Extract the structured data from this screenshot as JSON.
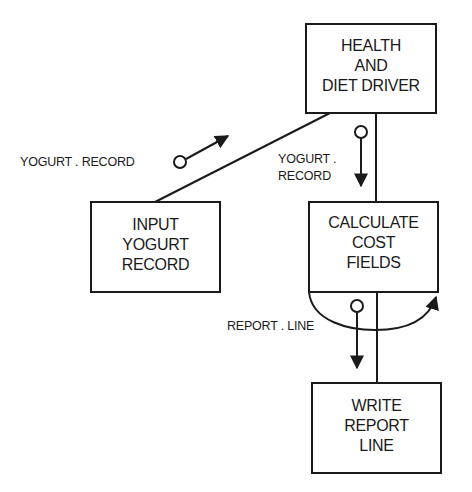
{
  "diagram": {
    "type": "structure-chart",
    "modules": [
      {
        "id": "health-diet-driver",
        "lines": [
          "HEALTH",
          "AND",
          "DIET DRIVER"
        ]
      },
      {
        "id": "input-yogurt-record",
        "lines": [
          "INPUT",
          "YOGURT",
          "RECORD"
        ]
      },
      {
        "id": "calculate-cost-fields",
        "lines": [
          "CALCULATE",
          "COST",
          "FIELDS"
        ]
      },
      {
        "id": "write-report-line",
        "lines": [
          "WRITE",
          "REPORT",
          "LINE"
        ]
      }
    ],
    "couples": [
      {
        "id": "yogurt-record-up",
        "lines": [
          "YOGURT . RECORD"
        ],
        "from": "input-yogurt-record",
        "to": "health-diet-driver"
      },
      {
        "id": "yogurt-record-down",
        "lines": [
          "YOGURT .",
          "RECORD"
        ],
        "from": "health-diet-driver",
        "to": "calculate-cost-fields"
      },
      {
        "id": "report-line",
        "lines": [
          "REPORT . LINE"
        ],
        "from": "calculate-cost-fields",
        "to": "write-report-line"
      }
    ],
    "connections": [
      {
        "from": "health-diet-driver",
        "to": "input-yogurt-record"
      },
      {
        "from": "health-diet-driver",
        "to": "calculate-cost-fields"
      },
      {
        "from": "calculate-cost-fields",
        "to": "write-report-line",
        "loop": true
      }
    ],
    "colors": {
      "line": "#1a1a1a",
      "background": "#ffffff"
    }
  }
}
